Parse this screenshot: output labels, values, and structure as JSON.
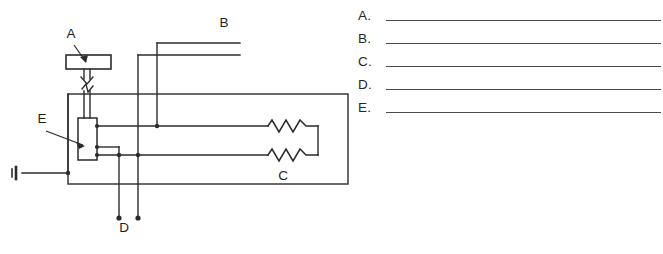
{
  "page": {
    "background_color": "#ffffff",
    "ink_color": "#1f1f1f",
    "line_color": "#2b2b2b"
  },
  "diagram": {
    "type": "electrical-schematic",
    "callouts": [
      {
        "id": "A",
        "label": "A",
        "points_to": "control-knob",
        "label_x": 71,
        "label_y": 38
      },
      {
        "id": "B",
        "label": "B",
        "points_to": "upper-output-lead",
        "label_x": 224,
        "label_y": 27
      },
      {
        "id": "C",
        "label": "C",
        "points_to": "resistor-pair",
        "label_x": 283,
        "label_y": 180
      },
      {
        "id": "D",
        "label": "D",
        "points_to": "lower-output-leads",
        "label_x": 124,
        "label_y": 232
      },
      {
        "id": "E",
        "label": "E",
        "points_to": "variable-resistor",
        "label_x": 42,
        "label_y": 123
      }
    ],
    "components": [
      {
        "name": "control-knob",
        "shape": "rectangle",
        "label": "A"
      },
      {
        "name": "shaft-break-symbol",
        "shape": "zigzag-break",
        "label": ""
      },
      {
        "name": "variable-resistor",
        "shape": "vertical-rectangle",
        "terminals": 3,
        "label": "E"
      },
      {
        "name": "resistor-upper",
        "shape": "zigzag-resistor",
        "label": "C"
      },
      {
        "name": "resistor-lower",
        "shape": "zigzag-resistor",
        "label": "C"
      },
      {
        "name": "ground-terminal",
        "shape": "terminal-bar",
        "label": ""
      },
      {
        "name": "enclosure-box",
        "shape": "rectangle",
        "label": ""
      }
    ]
  },
  "answers": {
    "heading": "",
    "rows": [
      {
        "letter": "A.",
        "value": ""
      },
      {
        "letter": "B.",
        "value": ""
      },
      {
        "letter": "C.",
        "value": ""
      },
      {
        "letter": "D.",
        "value": ""
      },
      {
        "letter": "E.",
        "value": ""
      }
    ]
  }
}
